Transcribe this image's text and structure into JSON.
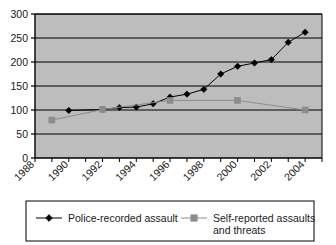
{
  "chart_data": {
    "type": "line",
    "title": "",
    "xlabel": "",
    "ylabel": "",
    "xlim": [
      1988,
      2005
    ],
    "ylim": [
      0,
      300
    ],
    "yticks": [
      0,
      50,
      100,
      150,
      200,
      250,
      300
    ],
    "ytick_labels": [
      "0",
      "50",
      "100",
      "150",
      "200",
      "250",
      "300"
    ],
    "xticks": [
      1988,
      1990,
      1992,
      1994,
      1996,
      1998,
      2000,
      2002,
      2004
    ],
    "xtick_labels": [
      "1988",
      "1990",
      "1992",
      "1994",
      "1996",
      "1998",
      "2000",
      "2002",
      "2004"
    ],
    "grid": "horizontal",
    "plot_background": "#bdbdbd",
    "legend_position": "bottom",
    "series": [
      {
        "name": "Police-recorded assault",
        "color": "#000000",
        "marker": "diamond",
        "x": [
          1990,
          1992,
          1993,
          1994,
          1995,
          1996,
          1997,
          1998,
          1999,
          2000,
          2001,
          2002,
          2003,
          2004
        ],
        "values": [
          99,
          101,
          105,
          106,
          113,
          127,
          133,
          143,
          175,
          191,
          198,
          205,
          241,
          262
        ]
      },
      {
        "name": "Self-reported assaults and threats",
        "color": "#8c8c8c",
        "marker": "square",
        "x": [
          1989,
          1992,
          1996,
          2000,
          2004
        ],
        "values": [
          79,
          101,
          120,
          120,
          100
        ]
      }
    ]
  },
  "legend": {
    "entries": [
      {
        "label": "Police-recorded assault",
        "color": "#000000",
        "marker": "diamond"
      },
      {
        "label": "Self-reported assaults",
        "label2": "and threats",
        "color": "#8c8c8c",
        "marker": "square"
      }
    ]
  }
}
